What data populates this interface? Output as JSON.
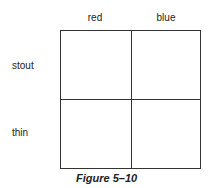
{
  "diagram": {
    "columns": [
      "red",
      "blue"
    ],
    "rows": [
      "stout",
      "thin"
    ],
    "cells": [
      [
        "",
        ""
      ],
      [
        "",
        ""
      ]
    ]
  },
  "caption": "Figure 5–10"
}
